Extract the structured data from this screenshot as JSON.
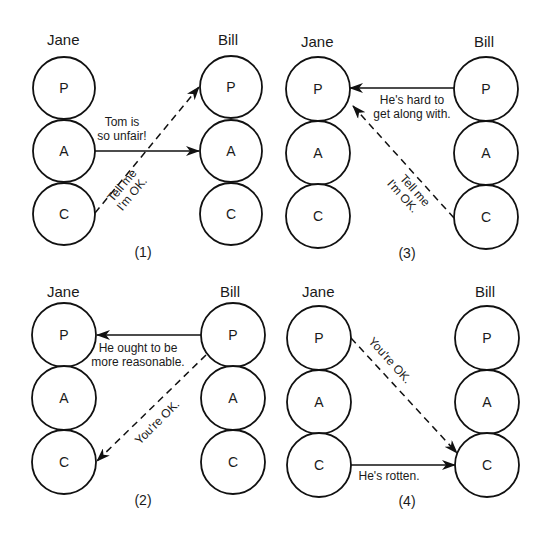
{
  "diagram": {
    "type": "transactional-analysis-ego-states",
    "person_left": "Jane",
    "person_right": "Bill",
    "ego_states": [
      "P",
      "A",
      "C"
    ],
    "panels": [
      {
        "number": "(1)",
        "left_name": "Jane",
        "right_name": "Bill",
        "states": [
          "P",
          "A",
          "C"
        ],
        "transactions": [
          {
            "style": "solid",
            "from": "Jane.A",
            "to": "Bill.A",
            "text_lines": [
              "Tom is",
              "so unfair!"
            ]
          },
          {
            "style": "dashed",
            "from": "Jane.C",
            "to": "Bill.P",
            "text_lines": [
              "Tell me",
              "I'm OK."
            ]
          }
        ]
      },
      {
        "number": "(2)",
        "left_name": "Jane",
        "right_name": "Bill",
        "states": [
          "P",
          "A",
          "C"
        ],
        "transactions": [
          {
            "style": "solid",
            "from": "Bill.P",
            "to": "Jane.P",
            "text_lines": [
              "He ought to be",
              "more reasonable."
            ]
          },
          {
            "style": "dashed",
            "from": "Bill.P",
            "to": "Jane.C",
            "text_lines": [
              "You're OK."
            ]
          }
        ]
      },
      {
        "number": "(3)",
        "left_name": "Jane",
        "right_name": "Bill",
        "states": [
          "P",
          "A",
          "C"
        ],
        "transactions": [
          {
            "style": "solid",
            "from": "Bill.P",
            "to": "Jane.P",
            "text_lines": [
              "He's hard to",
              "get along with."
            ]
          },
          {
            "style": "dashed",
            "from": "Bill.C",
            "to": "Jane.P",
            "text_lines": [
              "Tell me",
              "I'm OK."
            ]
          }
        ]
      },
      {
        "number": "(4)",
        "left_name": "Jane",
        "right_name": "Bill",
        "states": [
          "P",
          "A",
          "C"
        ],
        "transactions": [
          {
            "style": "solid",
            "from": "Jane.C",
            "to": "Bill.C",
            "text_lines": [
              "He's rotten."
            ]
          },
          {
            "style": "dashed",
            "from": "Jane.P",
            "to": "Bill.C",
            "text_lines": [
              "You're OK."
            ]
          }
        ]
      }
    ]
  },
  "colors": {
    "stroke": "#111111",
    "text": "#1a1a1a",
    "background": "#ffffff"
  }
}
